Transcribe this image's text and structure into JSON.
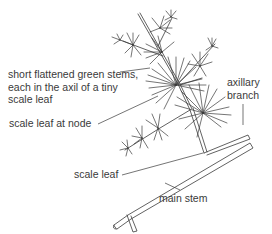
{
  "diagram": {
    "labels": {
      "cladodes_line1": "short flattened green stems,",
      "cladodes_line2": "each in the axil of a tiny",
      "cladodes_line3": "scale leaf",
      "scale_leaf_node": "scale leaf at node",
      "axillary_line1": "axillary",
      "axillary_line2": "branch",
      "scale_leaf": "scale leaf",
      "main_stem": "main stem"
    },
    "colors": {
      "ink": "#3a3a3a",
      "background": "#ffffff"
    }
  }
}
